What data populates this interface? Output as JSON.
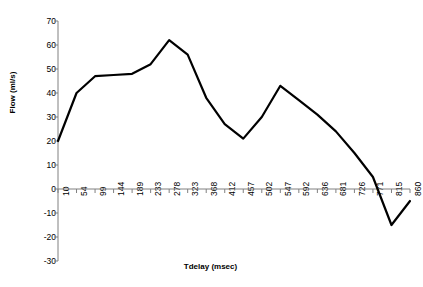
{
  "chart_data": {
    "type": "line",
    "title": "",
    "xlabel": "Tdelay (msec)",
    "ylabel": "Flow (ml/s)",
    "categories": [
      "10",
      "54",
      "99",
      "144",
      "189",
      "233",
      "278",
      "323",
      "368",
      "412",
      "457",
      "502",
      "547",
      "592",
      "636",
      "681",
      "726",
      "771",
      "815",
      "860"
    ],
    "values": [
      20,
      40,
      47,
      47.5,
      48,
      52,
      62,
      56,
      38,
      27,
      21,
      30,
      43,
      37,
      31,
      24,
      15,
      5,
      -15,
      -5
    ],
    "series": [
      {
        "name": "Flow",
        "values": [
          20,
          40,
          47,
          47.5,
          48,
          52,
          62,
          56,
          38,
          27,
          21,
          30,
          43,
          37,
          31,
          24,
          15,
          5,
          -15,
          -5
        ]
      }
    ],
    "yticks": [
      70,
      60,
      50,
      40,
      30,
      20,
      10,
      0,
      -10,
      -20,
      -30
    ],
    "ylim": [
      -30,
      70
    ],
    "grid": false,
    "legend": "none",
    "line_color": "#000000",
    "axis_color": "#808080"
  }
}
